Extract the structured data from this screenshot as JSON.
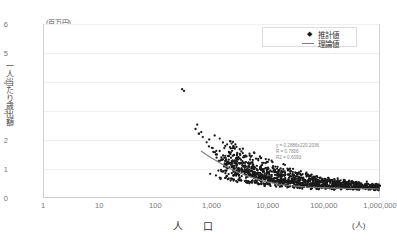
{
  "chart_data": {
    "type": "scatter",
    "title": "",
    "xlabel": "人　口",
    "ylabel": "一人当たり歳出額",
    "y_unit": "(百万円)",
    "x_unit": "(人)",
    "x_scale": "log",
    "y_scale": "linear",
    "xlim": [
      1,
      1000000
    ],
    "ylim": [
      0,
      6
    ],
    "grid": "horizontal",
    "legend_position": "top-right-inside",
    "x_ticks": [
      "1",
      "10",
      "100",
      "1,000",
      "10,000",
      "100,000",
      "1,000,000"
    ],
    "x_tick_values": [
      1,
      10,
      100,
      1000,
      10000,
      100000,
      1000000
    ],
    "y_ticks": [
      "0",
      "1",
      "2",
      "3",
      "4",
      "5",
      "6"
    ],
    "y_tick_values": [
      0,
      1,
      2,
      3,
      4,
      5,
      6
    ],
    "series": [
      {
        "name": "推計値",
        "marker": "dot",
        "color": "#1a1a1a",
        "points": [
          [
            300,
            3.75
          ],
          [
            520,
            2.38
          ],
          [
            600,
            2.22
          ],
          [
            700,
            2.1
          ],
          [
            820,
            1.92
          ],
          [
            900,
            1.78
          ],
          [
            1050,
            1.72
          ],
          [
            1150,
            1.58
          ],
          [
            1250,
            1.5
          ],
          [
            1400,
            1.62
          ],
          [
            1500,
            1.4
          ],
          [
            1600,
            1.33
          ],
          [
            1750,
            1.28
          ],
          [
            1900,
            1.2
          ],
          [
            2050,
            1.45
          ],
          [
            2200,
            1.15
          ],
          [
            2400,
            1.1
          ],
          [
            2600,
            1.26
          ],
          [
            2800,
            1.05
          ],
          [
            3000,
            1.0
          ],
          [
            3200,
            1.18
          ],
          [
            3500,
            0.95
          ],
          [
            3800,
            0.92
          ],
          [
            4100,
            1.08
          ],
          [
            4400,
            0.88
          ],
          [
            4800,
            0.85
          ],
          [
            5200,
            1.02
          ],
          [
            5600,
            0.82
          ],
          [
            6000,
            0.8
          ],
          [
            6500,
            0.96
          ],
          [
            7000,
            0.76
          ],
          [
            7600,
            0.74
          ],
          [
            8200,
            0.9
          ],
          [
            8800,
            0.72
          ],
          [
            9500,
            0.7
          ],
          [
            10500,
            0.86
          ],
          [
            11500,
            0.68
          ],
          [
            12500,
            0.66
          ],
          [
            13500,
            0.8
          ],
          [
            15000,
            0.64
          ],
          [
            16500,
            0.62
          ],
          [
            18000,
            0.75
          ],
          [
            20000,
            0.6
          ],
          [
            22000,
            0.58
          ],
          [
            24000,
            0.7
          ],
          [
            27000,
            0.56
          ],
          [
            30000,
            0.55
          ],
          [
            33000,
            0.66
          ],
          [
            37000,
            0.53
          ],
          [
            41000,
            0.52
          ],
          [
            46000,
            0.62
          ],
          [
            51000,
            0.5
          ],
          [
            57000,
            0.49
          ],
          [
            64000,
            0.58
          ],
          [
            71000,
            0.48
          ],
          [
            80000,
            0.47
          ],
          [
            90000,
            0.55
          ],
          [
            100000,
            0.46
          ],
          [
            115000,
            0.45
          ],
          [
            130000,
            0.52
          ],
          [
            150000,
            0.44
          ],
          [
            170000,
            0.43
          ],
          [
            195000,
            0.5
          ],
          [
            220000,
            0.42
          ],
          [
            250000,
            0.41
          ],
          [
            290000,
            0.48
          ],
          [
            330000,
            0.4
          ],
          [
            380000,
            0.4
          ],
          [
            440000,
            0.46
          ],
          [
            500000,
            0.39
          ],
          [
            580000,
            0.38
          ],
          [
            670000,
            0.44
          ],
          [
            780000,
            0.38
          ],
          [
            900000,
            0.37
          ],
          [
            1000000,
            0.42
          ],
          [
            1200,
            0.78
          ],
          [
            1800,
            0.7
          ],
          [
            2500,
            0.64
          ],
          [
            3400,
            0.6
          ],
          [
            4600,
            0.56
          ],
          [
            6200,
            0.53
          ],
          [
            8400,
            0.5
          ],
          [
            11000,
            0.47
          ],
          [
            15500,
            0.45
          ],
          [
            21000,
            0.43
          ],
          [
            28000,
            0.41
          ],
          [
            38000,
            0.4
          ],
          [
            52000,
            0.38
          ],
          [
            70000,
            0.37
          ],
          [
            95000,
            0.36
          ],
          [
            130000,
            0.35
          ],
          [
            180000,
            0.35
          ],
          [
            250000,
            0.34
          ],
          [
            350000,
            0.34
          ],
          [
            500000,
            0.33
          ],
          [
            700000,
            0.33
          ],
          [
            950000,
            0.33
          ],
          [
            1600,
            0.92
          ],
          [
            2300,
            0.86
          ],
          [
            3100,
            0.8
          ],
          [
            4200,
            0.75
          ],
          [
            5700,
            0.7
          ],
          [
            7800,
            0.66
          ],
          [
            10200,
            0.62
          ],
          [
            14000,
            0.58
          ],
          [
            19000,
            0.55
          ],
          [
            26000,
            0.52
          ],
          [
            35000,
            0.49
          ],
          [
            48000,
            0.46
          ],
          [
            66000,
            0.44
          ],
          [
            90000,
            0.42
          ],
          [
            125000,
            0.41
          ],
          [
            170000,
            0.39
          ],
          [
            235000,
            0.38
          ],
          [
            320000,
            0.37
          ],
          [
            450000,
            0.36
          ],
          [
            620000,
            0.36
          ],
          [
            860000,
            0.35
          ],
          [
            2900,
            1.35
          ],
          [
            4000,
            1.22
          ],
          [
            5400,
            1.12
          ],
          [
            7300,
            1.05
          ],
          [
            9900,
            0.98
          ],
          [
            13000,
            0.92
          ],
          [
            17500,
            0.86
          ],
          [
            23500,
            0.8
          ],
          [
            32000,
            0.75
          ],
          [
            43000,
            0.7
          ],
          [
            58000,
            0.66
          ],
          [
            78000,
            0.62
          ],
          [
            105000,
            0.58
          ],
          [
            142000,
            0.55
          ],
          [
            190000,
            0.52
          ],
          [
            260000,
            0.5
          ],
          [
            355000,
            0.48
          ],
          [
            480000,
            0.46
          ],
          [
            650000,
            0.45
          ],
          [
            890000,
            0.44
          ],
          [
            1400,
            2.05
          ],
          [
            1900,
            1.85
          ],
          [
            2600,
            1.7
          ],
          [
            3600,
            1.55
          ],
          [
            5000,
            1.42
          ],
          [
            6800,
            1.3
          ],
          [
            9200,
            1.2
          ],
          [
            12500,
            1.1
          ],
          [
            17000,
            1.02
          ],
          [
            23000,
            0.95
          ],
          [
            31000,
            0.88
          ],
          [
            42000,
            0.82
          ],
          [
            57000,
            0.76
          ],
          [
            77000,
            0.71
          ],
          [
            104000,
            0.66
          ],
          [
            140000,
            0.62
          ],
          [
            188000,
            0.58
          ],
          [
            253000,
            0.55
          ],
          [
            340000,
            0.52
          ],
          [
            460000,
            0.5
          ]
        ]
      },
      {
        "name": "理論値",
        "marker": "line",
        "color": "#808080",
        "points": [
          [
            650,
            1.62
          ],
          [
            800,
            1.5
          ],
          [
            1000,
            1.38
          ],
          [
            1300,
            1.25
          ],
          [
            1700,
            1.12
          ],
          [
            2200,
            1.0
          ],
          [
            2900,
            0.9
          ],
          [
            3800,
            0.8
          ],
          [
            5000,
            0.72
          ],
          [
            6600,
            0.65
          ],
          [
            8700,
            0.58
          ],
          [
            11500,
            0.53
          ],
          [
            15000,
            0.48
          ],
          [
            20000,
            0.45
          ],
          [
            26000,
            0.42
          ],
          [
            35000,
            0.4
          ],
          [
            46000,
            0.38
          ],
          [
            60000,
            0.37
          ],
          [
            80000,
            0.36
          ],
          [
            105000,
            0.35
          ],
          [
            140000,
            0.34
          ],
          [
            185000,
            0.34
          ],
          [
            245000,
            0.33
          ],
          [
            320000,
            0.33
          ],
          [
            425000,
            0.32
          ],
          [
            560000,
            0.32
          ],
          [
            740000,
            0.32
          ],
          [
            1000000,
            0.31
          ]
        ]
      }
    ],
    "annotations": {
      "equation": "y = 0.2886x220.2036",
      "r": "R = 0.7806",
      "r2": "R2 = 0.6093"
    }
  },
  "legend": {
    "items": [
      {
        "label": "推計値",
        "marker": "dot"
      },
      {
        "label": "理論値",
        "marker": "line"
      }
    ]
  }
}
